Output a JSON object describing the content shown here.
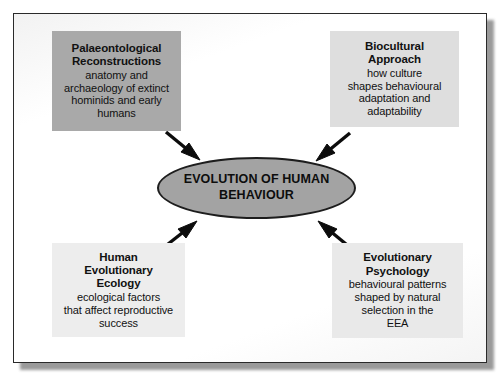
{
  "diagram": {
    "centre": {
      "label": "EVOLUTION OF HUMAN BEHAVIOUR",
      "line1": "EVOLUTION OF HUMAN",
      "line2": "BEHAVIOUR",
      "shape": "ellipse",
      "fill": "#a3a3a3",
      "stroke": "#1d1d1d"
    },
    "nodes": [
      {
        "id": "palaeontological-reconstructions",
        "position": "top-left",
        "title_line1": "Palaeontological",
        "title_line2": "Reconstructions",
        "desc_line1": "anatomy and",
        "desc_line2": "archaeology of extinct",
        "desc_line3": "hominids and early",
        "desc_line4": "humans",
        "fill": "#a9a9a9"
      },
      {
        "id": "biocultural-approach",
        "position": "top-right",
        "title_line1": "Biocultural",
        "title_line2": "Approach",
        "desc_line1": "how culture",
        "desc_line2": "shapes behavioural",
        "desc_line3": "adaptation and",
        "desc_line4": "adaptability",
        "fill": "#dedede"
      },
      {
        "id": "human-evolutionary-ecology",
        "position": "bottom-left",
        "title_line1": "Human",
        "title_line2": "Evolutionary",
        "title_line3": "Ecology",
        "desc_line1": "ecological factors",
        "desc_line2": "that affect reproductive",
        "desc_line3": "success",
        "fill": "#ededed"
      },
      {
        "id": "evolutionary-psychology",
        "position": "bottom-right",
        "title_line1": "Evolutionary",
        "title_line2": "Psychology",
        "desc_line1": "behavioural patterns",
        "desc_line2": "shaped by natural",
        "desc_line3": "selection in the",
        "desc_line4": "EEA",
        "fill": "#e9e9e9"
      }
    ],
    "arrows": [
      {
        "id": "arrow-top-left-to-centre",
        "from": "palaeontological-reconstructions",
        "to": "centre",
        "direction": "down-right"
      },
      {
        "id": "arrow-top-right-to-centre",
        "from": "biocultural-approach",
        "to": "centre",
        "direction": "down-left"
      },
      {
        "id": "arrow-bottom-left-to-centre",
        "from": "human-evolutionary-ecology",
        "to": "centre",
        "direction": "up-right"
      },
      {
        "id": "arrow-bottom-right-to-centre",
        "from": "evolutionary-psychology",
        "to": "centre",
        "direction": "up-left"
      }
    ],
    "frame": {
      "border_color": "#2a2a2a",
      "background": "#ffffff"
    }
  }
}
